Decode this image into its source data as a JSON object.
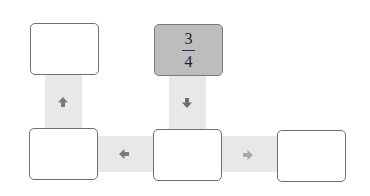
{
  "diagram": {
    "colors": {
      "connector": "#e8e8e8",
      "box_border": "#6f6f6f",
      "box_fill": "#ffffff",
      "start_box_fill": "#bdbdbd",
      "arrow_dark": "#7c7c7c",
      "arrow_light": "#a9a9a9"
    },
    "boxes": [
      {
        "id": "top-left",
        "value": ""
      },
      {
        "id": "top-center",
        "value": "3/4",
        "numerator": "3",
        "denominator": "4",
        "filled": true
      },
      {
        "id": "bottom-left",
        "value": ""
      },
      {
        "id": "bottom-center",
        "value": ""
      },
      {
        "id": "bottom-right",
        "value": ""
      }
    ],
    "arrows": [
      {
        "from": "bottom-left",
        "to": "top-left",
        "direction": "up",
        "icon": "arrow-up-icon"
      },
      {
        "from": "top-center",
        "to": "bottom-center",
        "direction": "down",
        "icon": "arrow-down-icon"
      },
      {
        "from": "bottom-center",
        "to": "bottom-left",
        "direction": "left",
        "icon": "arrow-left-icon"
      },
      {
        "from": "bottom-center",
        "to": "bottom-right",
        "direction": "right",
        "icon": "arrow-right-icon"
      }
    ]
  }
}
